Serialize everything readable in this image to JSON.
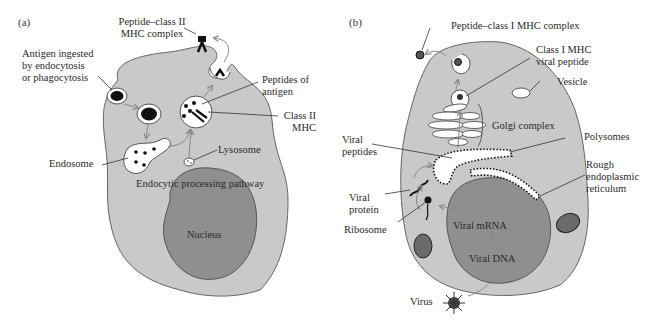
{
  "figure": {
    "panel_a": {
      "label": "(a)",
      "title": "Endocytic processing pathway",
      "labels": {
        "peptide_class2_line1": "Peptide–class II",
        "peptide_class2_line2": "MHC complex",
        "antigen_line1": "Antigen ingested",
        "antigen_line2": "by endocytosis",
        "antigen_line3": "or phagocytosis",
        "peptides_line1": "Peptides of",
        "peptides_line2": "antigen",
        "class2_line1": "Class II",
        "class2_line2": "MHC",
        "lysosome": "Lysosome",
        "endosome": "Endosome",
        "pathway": "Endocytic processing pathway",
        "nucleus": "Nucleus"
      }
    },
    "panel_b": {
      "label": "(b)",
      "labels": {
        "peptide_class1": "Peptide–class I MHC complex",
        "class1_line1": "Class I MHC",
        "class1_line2": "viral peptide",
        "vesicle": "Vesicle",
        "golgi": "Golgi complex",
        "viral_peptides_line1": "Viral",
        "viral_peptides_line2": "peptides",
        "polysomes": "Polysomes",
        "rer_line1": "Rough",
        "rer_line2": "endoplasmic",
        "rer_line3": "reticulum",
        "viral_protein_line1": "Viral",
        "viral_protein_line2": "protein",
        "ribosome": "Ribosome",
        "viral_mrna": "Viral mRNA",
        "viral_dna": "Viral DNA",
        "virus": "Virus"
      }
    },
    "colors": {
      "cytoplasm": "#c9c9c9",
      "nucleus": "#8f8f8f",
      "outline": "#555555",
      "arrow": "#8a8a8a",
      "dark": "#1a1a1a"
    }
  }
}
